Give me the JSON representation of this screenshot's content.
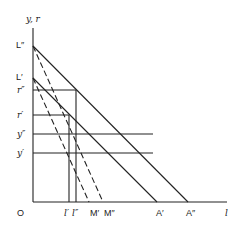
{
  "diagram": {
    "axes": {
      "y_label": "y, r",
      "x_label": "l",
      "origin_label": "O"
    },
    "y_axis_points": [
      {
        "id": "L2",
        "label": "L″"
      },
      {
        "id": "L1",
        "label": "L′"
      },
      {
        "id": "r2",
        "label": "r″"
      },
      {
        "id": "r1",
        "label": "r′"
      },
      {
        "id": "y2",
        "label": "y″"
      },
      {
        "id": "y1",
        "label": "y′"
      }
    ],
    "x_axis_points": [
      {
        "id": "l1",
        "label": "l′"
      },
      {
        "id": "l2",
        "label": "l″"
      },
      {
        "id": "M1",
        "label": "M′"
      },
      {
        "id": "M2",
        "label": "M″"
      },
      {
        "id": "A1",
        "label": "A′"
      },
      {
        "id": "A2",
        "label": "A″"
      }
    ],
    "lines": [
      {
        "id": "L2-A2",
        "from": "L″",
        "to": "A″",
        "style": "solid"
      },
      {
        "id": "L1-A1",
        "from": "L′",
        "to": "A′",
        "style": "solid"
      },
      {
        "id": "L2-M2",
        "from": "L″",
        "to": "M″",
        "style": "dashed"
      },
      {
        "id": "L1-M1",
        "from": "L′",
        "to": "M′",
        "style": "dashed"
      },
      {
        "id": "r2-line",
        "at": "r″",
        "style": "solid",
        "orientation": "horizontal"
      },
      {
        "id": "r1-line",
        "at": "r′",
        "style": "solid",
        "orientation": "horizontal"
      },
      {
        "id": "y2-line",
        "at": "y″",
        "style": "solid",
        "orientation": "horizontal"
      },
      {
        "id": "y1-line",
        "at": "y′",
        "style": "solid",
        "orientation": "horizontal"
      },
      {
        "id": "l1-line",
        "at": "l′",
        "style": "solid",
        "orientation": "vertical"
      },
      {
        "id": "l2-line",
        "at": "l″",
        "style": "solid",
        "orientation": "vertical"
      }
    ],
    "colors": {
      "ink": "#222222",
      "background": "#ffffff"
    }
  }
}
